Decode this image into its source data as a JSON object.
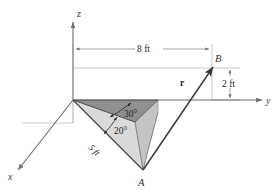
{
  "figure": {
    "background_color": "#ffffff",
    "axes": {
      "z_label": "z",
      "y_label": "y",
      "x_label": "x"
    },
    "points": {
      "A_label": "A",
      "B_label": "B"
    },
    "vector": {
      "r_label": "r"
    },
    "dimensions": {
      "horizontal": "8 ft",
      "vertical": "2 ft",
      "slant": "5 ft"
    },
    "angles": {
      "upper": "30°",
      "lower": "20°"
    },
    "colors": {
      "line": "#4d4d4d",
      "thin_line": "#9a9a9a",
      "dark_fill": "#8f8f8f",
      "light_fill": "#d8d8d8",
      "mid_fill": "#bdbdbd",
      "text": "#2b2b2b"
    }
  }
}
